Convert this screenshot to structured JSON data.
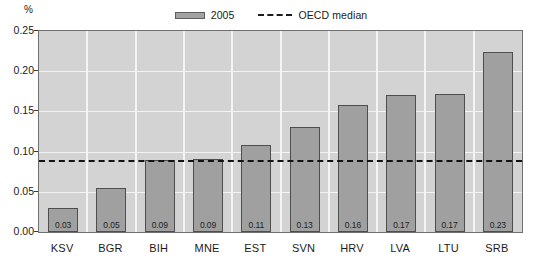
{
  "chart_data": {
    "type": "bar",
    "title": "",
    "subtitle": "",
    "unit_label": "%",
    "xlabel": "",
    "ylabel": "",
    "ylim": [
      0.0,
      0.25
    ],
    "ytick_labels": [
      "0.00",
      "0.05",
      "0.10",
      "0.15",
      "0.20",
      "0.25"
    ],
    "ytick_values": [
      0.0,
      0.05,
      0.1,
      0.15,
      0.2,
      0.25
    ],
    "grid": true,
    "legend_position": "top-center",
    "categories": [
      "KSV",
      "BGR",
      "BIH",
      "MNE",
      "EST",
      "SVN",
      "HRV",
      "LVA",
      "LTU",
      "SRB"
    ],
    "series": [
      {
        "name": "2005",
        "type": "bar",
        "color": "#a0a0a0",
        "values": [
          0.03,
          0.055,
          0.09,
          0.091,
          0.108,
          0.13,
          0.158,
          0.17,
          0.172,
          0.224
        ],
        "data_labels": [
          "0.03",
          "0.05",
          "0.09",
          "0.09",
          "0.11",
          "0.13",
          "0.16",
          "0.17",
          "0.17",
          "0.23"
        ]
      },
      {
        "name": "OECD median",
        "type": "line",
        "style": "dashed",
        "color": "#131313",
        "value": 0.09
      }
    ]
  },
  "legend": {
    "entries": [
      {
        "label": "2005",
        "marker": "bar-swatch"
      },
      {
        "label": "OECD median",
        "marker": "dashed-line"
      }
    ]
  }
}
